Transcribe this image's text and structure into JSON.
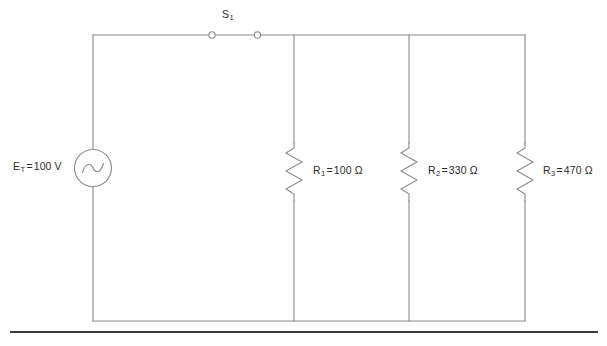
{
  "diagram": {
    "type": "schematic",
    "background_color": "#ffffff",
    "wire_color": "#8a8a8a",
    "text_color": "#2b2b2b",
    "rule_color": "#3a3a3a"
  },
  "source": {
    "symbol": "ac-voltage-source",
    "designator": "E",
    "subscript": "T",
    "equals": "=",
    "value": "100 V",
    "full_label": "E_T = 100 V"
  },
  "switch": {
    "symbol": "switch-closed",
    "designator": "S",
    "subscript": "1",
    "full_label": "S_1",
    "state": "closed"
  },
  "resistors": [
    {
      "symbol": "resistor-zigzag",
      "designator": "R",
      "subscript": "1",
      "equals": "=",
      "value": "100",
      "unit": "Ω",
      "full_label": "R_1 = 100 Ω"
    },
    {
      "symbol": "resistor-zigzag",
      "designator": "R",
      "subscript": "2",
      "equals": "=",
      "value": "330",
      "unit": "Ω",
      "full_label": "R_2 = 330 Ω"
    },
    {
      "symbol": "resistor-zigzag",
      "designator": "R",
      "subscript": "3",
      "equals": "=",
      "value": "470",
      "unit": "Ω",
      "full_label": "R_3 = 470 Ω"
    }
  ],
  "rule": {
    "name": "page-divider-rule"
  }
}
